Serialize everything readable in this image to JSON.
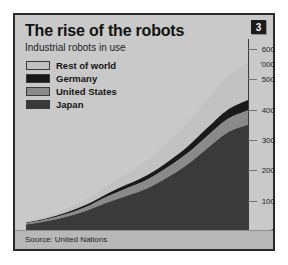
{
  "badge": {
    "number": "3"
  },
  "header": {
    "title": "The rise of the robots",
    "subtitle": "Industrial robots in use"
  },
  "footer": {
    "source": "Source: United Nations"
  },
  "colors": {
    "panel_background": "#c9c9c9",
    "panel_border": "#2b2b2b",
    "rest_of_world": "#c2c2c2",
    "germany": "#1a1a1a",
    "united_states": "#8a8a8a",
    "japan": "#3a3a3a",
    "badge_background": "#1b1b1b"
  },
  "legend": {
    "items": [
      {
        "label": "Rest of world",
        "color": "#c2c2c2"
      },
      {
        "label": "Germany",
        "color": "#1a1a1a"
      },
      {
        "label": "United States",
        "color": "#8a8a8a"
      },
      {
        "label": "Japan",
        "color": "#3a3a3a"
      }
    ]
  },
  "chart_data": {
    "type": "area",
    "stacked": true,
    "title": "The rise of the robots",
    "subtitle": "Industrial robots in use",
    "xlabel": "",
    "ylabel": "",
    "yunit": "'000",
    "yaxis_position": "right",
    "grid": false,
    "ylim": [
      0,
      600
    ],
    "yticks": [
      0,
      100,
      200,
      300,
      400,
      500,
      600
    ],
    "x": [
      1981,
      1982,
      1983,
      1984,
      1985,
      1986,
      1987,
      1988,
      1989,
      1990,
      1991,
      1992
    ],
    "categories": [
      "1981",
      "82",
      "83",
      "84",
      "85",
      "86",
      "87",
      "88",
      "89",
      "90",
      "91",
      "92"
    ],
    "series": [
      {
        "name": "Japan",
        "color": "#3a3a3a",
        "values": [
          21,
          32,
          47,
          67,
          93,
          116,
          140,
          176,
          219,
          274,
          325,
          350
        ]
      },
      {
        "name": "United States",
        "color": "#8a8a8a",
        "values": [
          4,
          6,
          9,
          13,
          20,
          25,
          29,
          33,
          37,
          40,
          44,
          47
        ]
      },
      {
        "name": "Germany",
        "color": "#1a1a1a",
        "values": [
          2,
          3,
          5,
          7,
          9,
          12,
          15,
          18,
          22,
          27,
          31,
          35
        ]
      },
      {
        "name": "Rest of world",
        "color": "#c2c2c2",
        "values": [
          5,
          8,
          12,
          18,
          26,
          36,
          48,
          62,
          78,
          94,
          110,
          122
        ]
      }
    ],
    "totals": [
      32,
      49,
      73,
      105,
      148,
      189,
      232,
      289,
      356,
      435,
      510,
      554
    ]
  },
  "xaxis": {
    "ticks": [
      "1981",
      "82",
      "83",
      "84",
      "85",
      "86",
      "87",
      "88",
      "89",
      "90",
      "91",
      "92"
    ]
  },
  "yaxis": {
    "ticks": [
      "600",
      "500",
      "400",
      "300",
      "200",
      "100",
      "0"
    ],
    "unit": "'000"
  }
}
